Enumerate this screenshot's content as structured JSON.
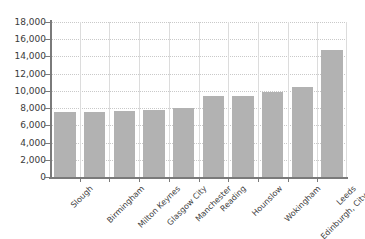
{
  "chart_data": {
    "type": "bar",
    "title": "",
    "subtitle": "",
    "xlabel": "",
    "ylabel": "",
    "categories": [
      "Slough",
      "Birmingham",
      "Milton Keynes",
      "Glasgow City",
      "Manchester",
      "Reading",
      "Hounslow",
      "Wokingham",
      "Edinburgh, City of",
      "Leeds"
    ],
    "values": [
      7600,
      7600,
      7700,
      7800,
      8000,
      9400,
      9400,
      9900,
      10400,
      14800
    ],
    "ylim": [
      0,
      18000
    ],
    "ytick_values": [
      0,
      2000,
      4000,
      6000,
      8000,
      10000,
      12000,
      14000,
      16000,
      18000
    ],
    "ytick_labels": [
      "0",
      "2,000",
      "4,000",
      "6,000",
      "8,000",
      "10,000",
      "12,000",
      "14,000",
      "16,000",
      "18,000"
    ],
    "grid": {
      "horizontal": true,
      "vertical": true
    },
    "legend": {
      "visible": false,
      "position": "none"
    },
    "series": [
      {
        "name": "",
        "values": [
          7600,
          7600,
          7700,
          7800,
          8000,
          9400,
          9400,
          9900,
          10400,
          14800
        ]
      }
    ],
    "colors": {
      "bar_fill": "#b2b2b2",
      "axis": "#7a7a7a",
      "gridline_horizontal": "#c9c9c9",
      "gridline_vertical": "#dcdcdc",
      "background": "#ffffff",
      "tick_label": "#3a3a3a"
    }
  }
}
